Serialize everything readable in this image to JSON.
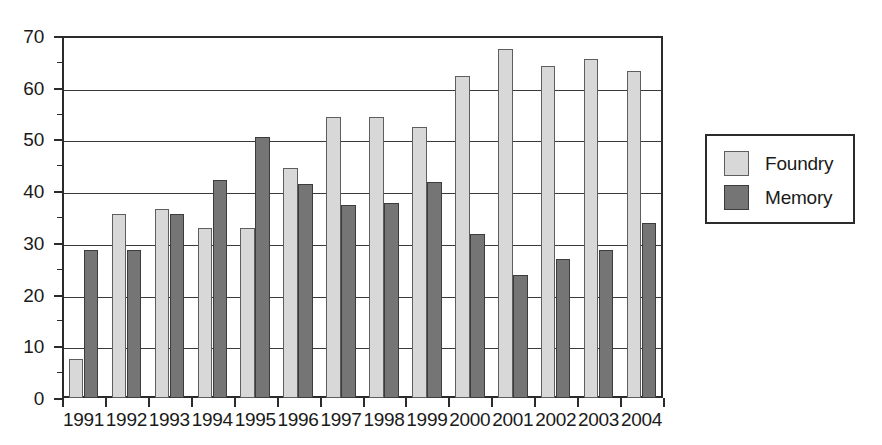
{
  "chart_data": {
    "type": "bar",
    "title": "",
    "subtitle": "",
    "xlabel": "",
    "ylabel": "",
    "ylim": [
      0,
      70
    ],
    "ytick_step": 10,
    "yticks": [
      0,
      10,
      20,
      30,
      40,
      50,
      60,
      70
    ],
    "grid": "horizontal",
    "legend_position": "right-outside",
    "categories": [
      "1991",
      "1992",
      "1993",
      "1994",
      "1995",
      "1996",
      "1997",
      "1998",
      "1999",
      "2000",
      "2001",
      "2002",
      "2003",
      "2004"
    ],
    "series": [
      {
        "name": "Foundry",
        "color": "#d8d8d8",
        "values": [
          7.5,
          35.5,
          36.5,
          32.8,
          32.9,
          44.4,
          54.3,
          54.4,
          52.4,
          62.3,
          67.4,
          64.2,
          65.5,
          63.2
        ]
      },
      {
        "name": "Memory",
        "color": "#757575",
        "values": [
          28.6,
          28.7,
          35.6,
          42.2,
          50.4,
          41.4,
          37.4,
          37.8,
          41.8,
          31.7,
          23.7,
          26.8,
          28.7,
          33.9
        ]
      }
    ]
  },
  "legend": {
    "entries": [
      {
        "label": "Foundry",
        "swatch": "foundry-swatch"
      },
      {
        "label": "Memory",
        "swatch": "memory-swatch"
      }
    ]
  },
  "colors": {
    "foundry": "#d8d8d8",
    "memory": "#757575",
    "axis": "#2b2b2b",
    "grid": "#3a3a3a",
    "background": "#ffffff"
  }
}
